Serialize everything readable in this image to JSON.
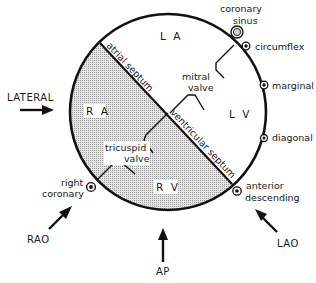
{
  "diagram": {
    "chambers": {
      "la": "L A",
      "lv": "L V",
      "ra": "R A",
      "rv": "R V"
    },
    "septa": {
      "atrial": "atrial septum",
      "ventricular": "ventricular septum"
    },
    "valves": {
      "mitral_line1": "mitral",
      "mitral_line2": "valve",
      "tricuspid_line1": "tricuspid",
      "tricuspid_line2": "valve"
    },
    "vessels": {
      "coronary_sinus_line1": "coronary",
      "coronary_sinus_line2": "sinus",
      "circumflex": "circumflex",
      "marginal": "marginal",
      "diagonal": "diagonal",
      "anterior_descending_line1": "anterior",
      "anterior_descending_line2": "descending",
      "right_coronary_line1": "right",
      "right_coronary_line2": "coronary"
    },
    "views": {
      "lateral": "LATERAL",
      "rao": "RAO",
      "ap": "AP",
      "lao": "LAO"
    },
    "colors": {
      "ink": "#111111",
      "shade": "#cfcfcf"
    }
  }
}
